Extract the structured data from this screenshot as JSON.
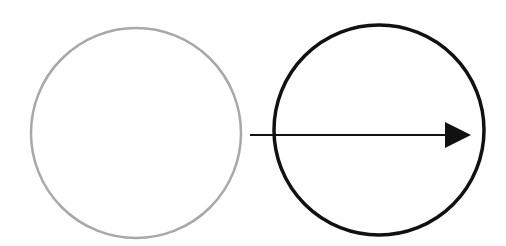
{
  "diagram": {
    "background": "#ffffff",
    "shapes": [
      {
        "id": "circle-left",
        "type": "circle",
        "cx": 136,
        "cy": 133,
        "r": 105,
        "stroke": "#a8a8a8",
        "stroke_width": 2.5,
        "fill": "none"
      },
      {
        "id": "circle-right",
        "type": "circle",
        "cx": 379,
        "cy": 130,
        "r": 105,
        "stroke": "#111111",
        "stroke_width": 3.5,
        "fill": "none"
      }
    ],
    "arrow": {
      "x1": 250,
      "y1": 135,
      "x2": 447,
      "y2": 135,
      "head_tip_x": 471,
      "head_top_y": 122,
      "head_bottom_y": 148,
      "stroke": "#111111",
      "stroke_width": 2
    }
  }
}
